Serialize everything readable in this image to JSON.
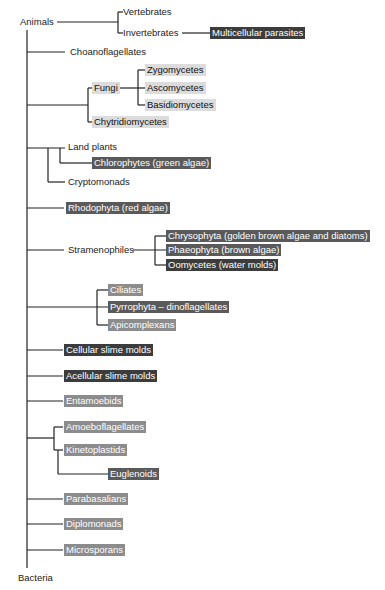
{
  "diagram": {
    "type": "phylogenetic-tree",
    "root_top": "Animals",
    "root_bottom": "Bacteria",
    "colors": {
      "line": "#222222",
      "light_highlight": "#dcdcdc",
      "mid_highlight": "#8c8c8c",
      "mid_dark_highlight": "#5a5a5a",
      "dark_highlight": "#3c3c3c"
    },
    "nodes": {
      "animals": "Animals",
      "vertebrates": "Vertebrates",
      "invertebrates": "Invertebrates",
      "multicellular_parasites": "Multicellular parasites",
      "choanoflagellates": "Choanoflagellates",
      "fungi": "Fungi",
      "zygomycetes": "Zygomycetes",
      "ascomycetes": "Ascomycetes",
      "basidiomycetes": "Basidiomycetes",
      "chytridiomycetes": "Chytridiomycetes",
      "land_plants": "Land plants",
      "chlorophytes": "Chlorophytes (green algae)",
      "cryptomonads": "Cryptomonads",
      "rhodophyta": "Rhodophyta (red algae)",
      "stramenophiles": "Stramenophiles",
      "chrysophyta": "Chrysophyta (golden brown algae and diatoms)",
      "phaeophyta": "Phaeophyta (brown algae)",
      "oomycetes": "Oomycetes (water molds)",
      "ciliates": "Ciliates",
      "pyrrophyta": "Pyrrophyta – dinoflagellates",
      "apicomplexans": "Apicomplexans",
      "cellular_slime_molds": "Cellular slime molds",
      "acellular_slime_molds": "Acellular slime molds",
      "entamoebids": "Entamoebids",
      "amoeboflagellates": "Amoeboflagellates",
      "kinetoplastids": "Kinetoplastids",
      "euglenoids": "Euglenoids",
      "parabasalians": "Parabasalians",
      "diplomonads": "Diplomonads",
      "microsporans": "Microsporans",
      "bacteria": "Bacteria"
    }
  }
}
